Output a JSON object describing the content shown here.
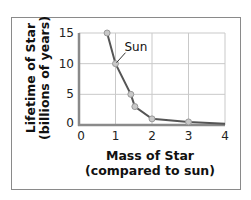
{
  "chart_data": {
    "type": "line",
    "title": "",
    "xlabel": "Mass of Star (compared to sun)",
    "xlabel_lines": [
      "Mass of Star",
      "(compared to sun)"
    ],
    "ylabel": "Lifetime of Star (billions of years)",
    "ylabel_lines": [
      "Lifetime of Star",
      "(billions of years)"
    ],
    "xlim": [
      0,
      4
    ],
    "ylim": [
      0,
      15
    ],
    "xticks": [
      "0",
      "1",
      "2",
      "3",
      "4"
    ],
    "yticks": [
      "0",
      "5",
      "10",
      "15"
    ],
    "grid": true,
    "legend": null,
    "series": [
      {
        "name": "Star lifetime",
        "x": [
          0.77,
          1.0,
          1.42,
          1.53,
          2.0,
          3.0,
          4.0
        ],
        "y": [
          15,
          10,
          5,
          3,
          1,
          0.5,
          0.2
        ],
        "markers": [
          true,
          true,
          true,
          true,
          true,
          true,
          false
        ]
      }
    ],
    "annotations": [
      {
        "text": "Sun",
        "x": 1.0,
        "y": 10
      }
    ]
  },
  "colors": {
    "line": "#555555",
    "marker_fill": "#c8c8c8",
    "grid": "#c9c9c9",
    "axis": "#8a8a8a",
    "frame": "#8a8a8a"
  }
}
